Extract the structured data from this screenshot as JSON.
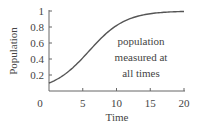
{
  "chart_data": {
    "type": "line",
    "title": "",
    "xlabel": "Time",
    "ylabel": "Population",
    "xlim": [
      0,
      20
    ],
    "ylim": [
      0,
      1
    ],
    "xticks": [
      0,
      5,
      10,
      15,
      20
    ],
    "yticks": [
      0.2,
      0.4,
      0.6,
      0.8,
      1
    ],
    "xtick_labels": [
      "0",
      "5",
      "10",
      "15",
      "20"
    ],
    "ytick_labels": [
      "0.2",
      "0.4",
      "0.6",
      "0.8",
      "1"
    ],
    "grid": false,
    "legend": null,
    "annotations": [
      {
        "text": [
          "population",
          "measured at",
          "all times"
        ],
        "x": 13,
        "y": 0.55
      }
    ],
    "series": [
      {
        "name": "population",
        "x": [
          0,
          1,
          2,
          3,
          4,
          5,
          6,
          7,
          8,
          9,
          10,
          11,
          12,
          13,
          14,
          15,
          16,
          17,
          18,
          19,
          20
        ],
        "values": [
          0.1,
          0.14,
          0.19,
          0.25,
          0.33,
          0.42,
          0.51,
          0.6,
          0.69,
          0.76,
          0.82,
          0.87,
          0.91,
          0.93,
          0.95,
          0.96,
          0.97,
          0.98,
          0.985,
          0.99,
          0.99
        ]
      }
    ],
    "colors": {
      "line": "#555555",
      "axis": "#666666"
    }
  }
}
